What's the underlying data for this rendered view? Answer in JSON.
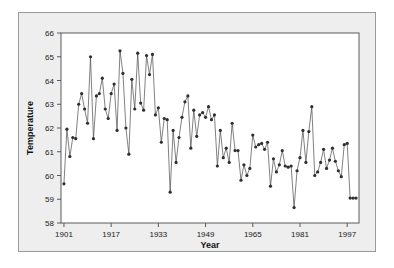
{
  "figure": {
    "panel_background": "#eeeeee",
    "plot_background": "#ffffff",
    "frame_color": "#5a5a5a",
    "series_color": "#3a3a3a"
  },
  "chart_data": {
    "type": "line",
    "title": "",
    "subtitle": "",
    "xlabel": "Year",
    "ylabel": "Temperature",
    "xlim": [
      1900,
      2001
    ],
    "ylim": [
      58,
      66
    ],
    "xticks": [
      1901,
      1917,
      1933,
      1949,
      1965,
      1981,
      1997
    ],
    "xtick_labels": [
      "1901",
      "1917",
      "1933",
      "1949",
      "1965",
      "1981",
      "1997"
    ],
    "yticks": [
      58,
      59,
      60,
      61,
      62,
      63,
      64,
      65,
      66
    ],
    "ytick_labels": [
      "58",
      "59",
      "60",
      "61",
      "62",
      "63",
      "64",
      "65",
      "66"
    ],
    "grid": false,
    "legend": null,
    "marker": "filled-circle",
    "x": [
      1901,
      1902,
      1903,
      1904,
      1905,
      1906,
      1907,
      1908,
      1909,
      1910,
      1911,
      1912,
      1913,
      1914,
      1915,
      1916,
      1917,
      1918,
      1919,
      1920,
      1921,
      1922,
      1923,
      1924,
      1925,
      1926,
      1927,
      1928,
      1929,
      1930,
      1931,
      1932,
      1933,
      1934,
      1935,
      1936,
      1937,
      1938,
      1939,
      1940,
      1941,
      1942,
      1943,
      1944,
      1945,
      1946,
      1947,
      1948,
      1949,
      1950,
      1951,
      1952,
      1953,
      1954,
      1955,
      1956,
      1957,
      1958,
      1959,
      1960,
      1961,
      1962,
      1963,
      1964,
      1965,
      1966,
      1967,
      1968,
      1969,
      1970,
      1971,
      1972,
      1973,
      1974,
      1975,
      1976,
      1977,
      1978,
      1979,
      1980,
      1981,
      1982,
      1983,
      1984,
      1985,
      1986,
      1987,
      1988,
      1989,
      1990,
      1991,
      1992,
      1993,
      1994,
      1995,
      1996,
      1997,
      1998,
      1999,
      2000
    ],
    "values": [
      59.65,
      61.95,
      60.8,
      61.6,
      61.55,
      63.0,
      63.45,
      62.8,
      62.2,
      65.0,
      61.55,
      63.35,
      63.45,
      64.1,
      62.8,
      62.4,
      63.45,
      63.85,
      61.9,
      65.25,
      64.3,
      62.0,
      60.9,
      64.05,
      62.8,
      65.15,
      63.05,
      62.75,
      65.05,
      64.25,
      65.1,
      62.55,
      62.85,
      61.4,
      62.4,
      62.35,
      59.3,
      61.9,
      60.55,
      61.6,
      62.45,
      63.1,
      63.35,
      61.15,
      62.75,
      61.65,
      62.55,
      62.65,
      62.45,
      62.9,
      62.35,
      62.55,
      60.4,
      61.9,
      60.75,
      61.15,
      60.55,
      62.2,
      61.05,
      61.05,
      59.8,
      60.45,
      60.0,
      60.3,
      61.7,
      61.2,
      61.3,
      61.35,
      61.1,
      61.4,
      59.55,
      60.7,
      60.15,
      60.45,
      61.05,
      60.4,
      60.35,
      60.4,
      58.65,
      60.2,
      60.75,
      61.9,
      60.55,
      61.85,
      62.9,
      60.0,
      60.15,
      60.55,
      61.1,
      60.3,
      60.65,
      61.15,
      60.6,
      60.2,
      59.95,
      61.3,
      61.35,
      59.05,
      59.05,
      59.05
    ]
  },
  "axes": {
    "x_title": "Year",
    "y_title": "Temperature"
  }
}
